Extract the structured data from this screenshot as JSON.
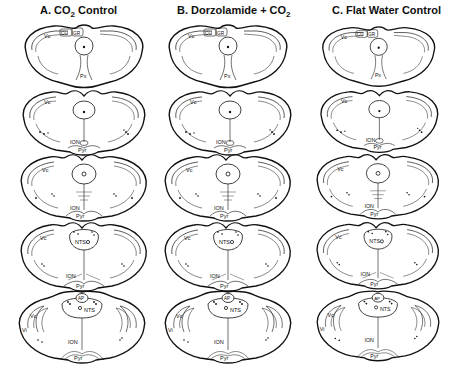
{
  "figure": {
    "columns": [
      {
        "id": "A",
        "prefix": "A.",
        "title": "CO",
        "sub": "2",
        "suffix": " Control",
        "full": "A. CO2 Control"
      },
      {
        "id": "B",
        "prefix": "B.",
        "title": "Dorzolamide + CO",
        "sub": "2",
        "suffix": "",
        "full": "B. Dorzolamide + CO2"
      },
      {
        "id": "C",
        "prefix": "C.",
        "title": "Flat Water Control",
        "sub": "",
        "suffix": "",
        "full": "C. Flat Water Control"
      }
    ],
    "rows": [
      {
        "index": 1,
        "labels": [
          "Vc",
          "CU",
          "GR",
          "Px"
        ]
      },
      {
        "index": 2,
        "labels": [
          "Vc",
          "ION",
          "Pyr"
        ]
      },
      {
        "index": 3,
        "labels": [
          "Vc",
          "ION",
          "Pyr"
        ]
      },
      {
        "index": 4,
        "labels": [
          "Vc",
          "NTS",
          "ION",
          "Pyr"
        ]
      },
      {
        "index": 5,
        "labels": [
          "Vc",
          "Vi",
          "AP",
          "NTS",
          "ION",
          "Pyr"
        ]
      }
    ],
    "labels": {
      "vc": "Vc",
      "vi": "Vi",
      "cu": "CU",
      "gr": "GR",
      "px": "Px",
      "ion": "ION",
      "pyr": "Pyr",
      "nts": "NTS",
      "ap": "AP"
    },
    "colors": {
      "ink": "#111111",
      "background": "#ffffff"
    }
  }
}
